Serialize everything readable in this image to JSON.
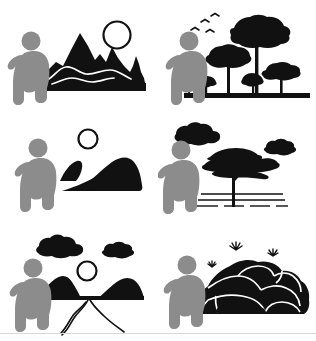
{
  "document": {
    "title": "Human Observing Landscapes Pictogram Set",
    "background_color": "#ffffff",
    "width": 316,
    "height": 341,
    "layout": "2 columns x 3 rows grid of pictograms"
  },
  "palette": {
    "figure_gray": "#8c8c8c",
    "landscape_black": "#111111",
    "outline_white": "#ffffff",
    "border_gray": "#d8d8d8",
    "page_white": "#ffffff"
  },
  "figure": {
    "name": "crouching-person-silhouette",
    "pose": "squatting, facing right, one arm extended forward",
    "color": "#8c8c8c",
    "appears_in_panels": [
      1,
      2,
      3,
      4,
      5,
      6
    ]
  },
  "panels": [
    {
      "index": 1,
      "position": "top-left",
      "name": "mountains-with-sun",
      "caption": "Person crouching before jagged mountain range with winding trail and sun",
      "elements": [
        {
          "name": "sun-circle",
          "style": "outline circle, unfilled",
          "color": "#111111"
        },
        {
          "name": "mountain-range",
          "style": "filled black jagged peaks",
          "color": "#111111"
        },
        {
          "name": "winding-trail",
          "style": "white curved line across mountains",
          "color": "#ffffff"
        },
        {
          "name": "ground-baseline",
          "style": "horizontal black bar",
          "color": "#111111"
        },
        {
          "name": "crouching-person-silhouette",
          "color": "#8c8c8c"
        }
      ]
    },
    {
      "index": 2,
      "position": "top-right",
      "name": "forest-with-birds",
      "caption": "Person crouching before cluster of trees with birds flying overhead",
      "elements": [
        {
          "name": "bird-flock",
          "count": 4,
          "style": "small v-shaped marks",
          "color": "#111111"
        },
        {
          "name": "tall-tree",
          "style": "umbrella canopy on slim trunk",
          "color": "#111111"
        },
        {
          "name": "medium-tree",
          "count": 2,
          "color": "#111111"
        },
        {
          "name": "small-tree",
          "count": 3,
          "color": "#111111"
        },
        {
          "name": "ground-baseline",
          "style": "horizontal black bar",
          "color": "#111111"
        },
        {
          "name": "crouching-person-silhouette",
          "color": "#8c8c8c"
        }
      ]
    },
    {
      "index": 3,
      "position": "middle-left",
      "name": "rolling-hills-with-sun",
      "caption": "Person crouching before smooth rolling dunes and sun",
      "elements": [
        {
          "name": "sun-circle",
          "style": "outline circle, unfilled",
          "color": "#111111"
        },
        {
          "name": "hill-small",
          "style": "filled black dune",
          "color": "#111111"
        },
        {
          "name": "hill-large",
          "style": "filled black dune with curved ridge",
          "color": "#111111"
        },
        {
          "name": "crouching-person-silhouette",
          "color": "#8c8c8c"
        }
      ]
    },
    {
      "index": 4,
      "position": "middle-right",
      "name": "acacia-tree-savanna",
      "caption": "Person crouching before flat-topped acacia tree with clouds and dashed ground",
      "elements": [
        {
          "name": "cloud-large",
          "style": "bumpy black cloud",
          "color": "#111111"
        },
        {
          "name": "cloud-small",
          "style": "bumpy black cloud",
          "color": "#111111"
        },
        {
          "name": "acacia-tree",
          "style": "layered flat canopy with forked trunk",
          "color": "#111111"
        },
        {
          "name": "ground-dashes",
          "style": "horizontal dashed lines",
          "color": "#111111"
        },
        {
          "name": "crouching-person-silhouette",
          "color": "#8c8c8c"
        }
      ]
    },
    {
      "index": 5,
      "position": "bottom-left",
      "name": "river-valley-with-sun-and-clouds",
      "caption": "Person crouching before valley with river running between two hills, sun and clouds above",
      "elements": [
        {
          "name": "cloud-large",
          "style": "bumpy black cloud",
          "color": "#111111"
        },
        {
          "name": "cloud-small",
          "style": "bumpy black cloud",
          "color": "#111111"
        },
        {
          "name": "sun-circle",
          "style": "outline circle, unfilled",
          "color": "#111111"
        },
        {
          "name": "hill-left",
          "style": "filled black peak",
          "color": "#111111"
        },
        {
          "name": "hill-right",
          "style": "filled black peak",
          "color": "#111111"
        },
        {
          "name": "river-path",
          "style": "white wedge with black outline widening to foreground",
          "color": "#ffffff"
        },
        {
          "name": "crouching-person-silhouette",
          "color": "#8c8c8c"
        }
      ]
    },
    {
      "index": 6,
      "position": "bottom-right",
      "name": "rock-formation-with-plants",
      "caption": "Person crouching before boulder pile with small grass tufts sprouting on top",
      "elements": [
        {
          "name": "boulder-cluster",
          "style": "filled black rocks with white crack outlines",
          "color": "#111111"
        },
        {
          "name": "rock-crack-lines",
          "style": "white outlines between boulders",
          "color": "#ffffff"
        },
        {
          "name": "grass-tuft",
          "count": 3,
          "style": "small spiky sprouts",
          "color": "#111111"
        },
        {
          "name": "crouching-person-silhouette",
          "color": "#8c8c8c"
        }
      ]
    }
  ]
}
